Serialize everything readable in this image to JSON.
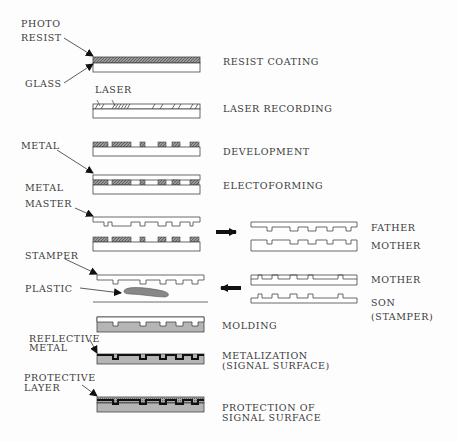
{
  "left_labels": {
    "photo": "PHOTO",
    "resist": "RESIST",
    "glass": "GLASS",
    "laser": "LASER",
    "metal": "METAL",
    "metal_master_1": "METAL",
    "metal_master_2": "MASTER",
    "stamper": "STAMPER",
    "plastic": "PLASTIC",
    "reflective_1": "REFLECTIVE",
    "reflective_2": "METAL",
    "protective_1": "PROTECTIVE",
    "protective_2": "LAYER"
  },
  "steps": [
    {
      "label": "RESIST COATING"
    },
    {
      "label": "LASER RECORDING"
    },
    {
      "label": "DEVELOPMENT"
    },
    {
      "label": "ELECTOFORMING"
    },
    {
      "label": "MOLDING"
    },
    {
      "label_1": "METALIZATION",
      "label_2": "(SIGNAL SURFACE)"
    },
    {
      "label_1": "PROTECTION OF",
      "label_2": "SIGNAL SURFACE"
    }
  ],
  "replication": {
    "father": "FATHER",
    "mother_1": "MOTHER",
    "mother_2": "MOTHER",
    "son_1": "SON",
    "son_2": "(STAMPER)"
  },
  "colors": {
    "line": "#444444",
    "resist_fill": "#8a8a8a",
    "plastic_fill": "#b5b5b5",
    "metal_fill": "#222222"
  }
}
